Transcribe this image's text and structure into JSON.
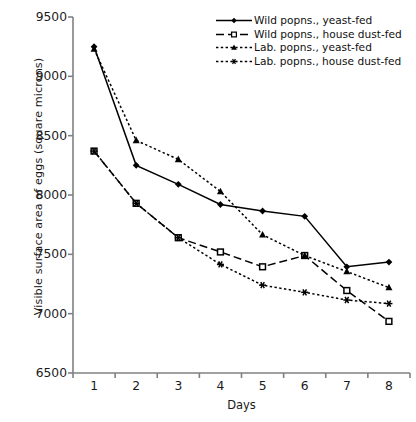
{
  "chart_data": {
    "type": "line",
    "title": "",
    "xlabel": "Days",
    "ylabel": "Visible surface area of eggs (square microns)",
    "categories": [
      "1",
      "2",
      "3",
      "4",
      "5",
      "6",
      "7",
      "8"
    ],
    "x": [
      1,
      2,
      3,
      4,
      5,
      6,
      7,
      8
    ],
    "ylim": [
      6500,
      9500
    ],
    "yticks": [
      6500,
      7000,
      7500,
      8000,
      8500,
      9000,
      9500
    ],
    "ytick_labels": [
      "6500",
      "7000",
      "7500",
      "8000",
      "8500",
      "9000",
      "9500"
    ],
    "grid": false,
    "legend_position": "top-right",
    "series": [
      {
        "name": "Wild popns., yeast-fed",
        "marker": "filled-diamond",
        "line_style": "solid",
        "color": "#000000",
        "values": [
          9250,
          8250,
          8090,
          7920,
          7865,
          7820,
          7395,
          7435
        ]
      },
      {
        "name": "Wild popns., house dust-fed",
        "marker": "open-square",
        "line_style": "dashed",
        "color": "#000000",
        "values": [
          8370,
          7930,
          7640,
          7520,
          7395,
          7490,
          7195,
          6935
        ]
      },
      {
        "name": "Lab. popns., yeast-fed",
        "marker": "filled-triangle",
        "line_style": "dotted",
        "color": "#000000",
        "values": [
          9230,
          8460,
          8300,
          8030,
          7665,
          7490,
          7355,
          7220
        ]
      },
      {
        "name": "Lab. popns., house dust-fed",
        "marker": "asterisk",
        "line_style": "dotted",
        "color": "#000000",
        "values": [
          8370,
          7930,
          7640,
          7415,
          7240,
          7180,
          7115,
          7085
        ]
      }
    ]
  },
  "axis": {
    "color": "#808080"
  }
}
